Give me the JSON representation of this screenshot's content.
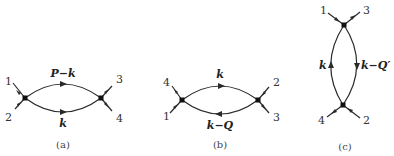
{
  "diagrams": [
    {
      "id": "a",
      "caption": "(a)",
      "external_labels": [
        "1",
        "2",
        "3",
        "4"
      ],
      "internal_lines": [
        {
          "label": "P−k",
          "position": "upper",
          "direction": "left-to-right"
        },
        {
          "label": "k",
          "position": "lower",
          "direction": "left-to-right"
        }
      ]
    },
    {
      "id": "b",
      "caption": "(b)",
      "external_labels": [
        "4",
        "1",
        "2",
        "3"
      ],
      "internal_lines": [
        {
          "label": "k",
          "position": "upper",
          "direction": "left-to-right"
        },
        {
          "label": "k−Q",
          "position": "lower",
          "direction": "right-to-left"
        }
      ]
    },
    {
      "id": "c",
      "caption": "(c)",
      "external_labels": [
        "1",
        "3",
        "4",
        "2"
      ],
      "internal_lines": [
        {
          "label": "k",
          "position": "left",
          "direction": "bottom-to-top"
        },
        {
          "label": "k−Q′",
          "position": "right",
          "direction": "top-to-bottom"
        }
      ]
    }
  ]
}
